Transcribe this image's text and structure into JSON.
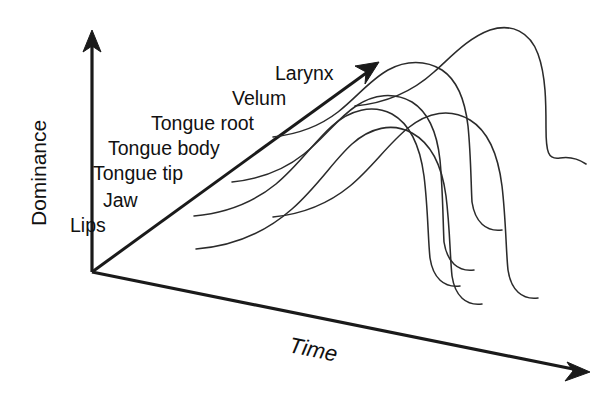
{
  "figure": {
    "kind": "schematic-diagram",
    "background_color": "#ffffff",
    "ink_color": "#1a1a1a",
    "curve_color": "#2b2b2b",
    "width": 614,
    "height": 398
  },
  "axes": {
    "vertical": {
      "label": "Dominance",
      "icon": "up-arrow-icon",
      "orientation": "vertical",
      "rotation_deg": -90,
      "origin": [
        92,
        272
      ],
      "tip": [
        92,
        32
      ]
    },
    "depth": {
      "label": "",
      "icon": "diagonal-arrow-icon",
      "orientation": "diagonal-up-right",
      "origin": [
        92,
        272
      ],
      "tip": [
        377,
        64
      ]
    },
    "horizontal": {
      "label": "Time",
      "icon": "right-arrow-icon",
      "orientation": "horizontal-down-right",
      "italic": true,
      "origin": [
        92,
        272
      ],
      "tip": [
        588,
        372
      ]
    }
  },
  "tiers": [
    {
      "label": "Lips",
      "x": 70,
      "y": 232,
      "order": 1
    },
    {
      "label": "Jaw",
      "x": 103,
      "y": 207,
      "order": 2
    },
    {
      "label": "Tongue tip",
      "x": 93,
      "y": 180,
      "order": 3
    },
    {
      "label": "Tongue body",
      "x": 108,
      "y": 155,
      "order": 4
    },
    {
      "label": "Tongue root",
      "x": 151,
      "y": 130,
      "order": 5
    },
    {
      "label": "Velum",
      "x": 232,
      "y": 105,
      "order": 6
    },
    {
      "label": "Larynx",
      "x": 275,
      "y": 80,
      "order": 7
    }
  ],
  "curves": [
    {
      "name": "lips-dominance-curve",
      "tier": "Lips",
      "path": "M 196 249 C 236 246 266 232 292 209 C 318 186 334 160 352 144 C 370 128 392 122 412 133 C 432 144 442 166 446 196 C 450 228 450 258 452 276 C 455 296 466 306 482 304"
    },
    {
      "name": "jaw-dominance-curve",
      "tier": "Jaw",
      "path": "M 194 216 C 228 213 254 202 276 184 C 298 166 314 142 332 126 C 350 110 372 104 392 114 C 410 124 420 146 424 176 C 428 208 428 240 430 258 C 433 278 444 288 460 286"
    },
    {
      "name": "tongue-tip-dominance-curve",
      "tier": "Tongue tip",
      "path": "M 232 182 C 262 179 284 170 304 154 C 324 138 338 118 356 106 C 374 94 394 92 412 102 C 428 112 437 132 440 160 C 443 192 443 224 444 242 C 447 262 458 272 474 270"
    },
    {
      "name": "tongue-body-dominance-curve",
      "tier": "Tongue body",
      "path": "M 273 137 C 300 134 320 126 338 112 C 356 98 370 80 388 70 C 406 60 426 60 442 70 C 457 80 465 100 468 126 C 471 156 471 186 472 202 C 475 222 486 232 502 230"
    },
    {
      "name": "tongue-root-dominance-curve",
      "tier": "Tongue root",
      "path": "M 273 217 C 304 214 328 204 350 186 C 372 168 388 144 408 128 C 428 112 450 108 470 120 C 488 131 498 154 502 186 C 506 220 506 252 508 270 C 511 290 522 300 538 298"
    },
    {
      "name": "velum-larynx-dominance-curve",
      "tier": "Larynx",
      "path": "M 355 106 C 386 103 412 92 434 72 C 452 56 468 38 490 30 C 512 23 530 32 538 54 C 546 76 546 104 546 128 C 546 152 548 160 560 158 C 572 156 580 160 586 164"
    }
  ]
}
